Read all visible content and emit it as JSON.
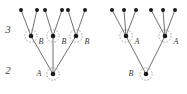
{
  "figure": {
    "background_color": "#ffffff",
    "line_color": "#4d4d4d",
    "node_color": "#1a1a1a",
    "halo_color": "#8c8c8c",
    "label_color": "#3a3a3a",
    "level_label_color": "#4a4a4a",
    "width": 187,
    "height": 94
  },
  "level_labels": [
    {
      "text": "3",
      "x": 8,
      "y": 33
    },
    {
      "text": "2",
      "x": 8,
      "y": 74
    }
  ],
  "left_diagram": {
    "name": "left-tree",
    "leaf_nodes": [
      {
        "id": "L1",
        "x": 21,
        "y": 10
      },
      {
        "id": "L2",
        "x": 37,
        "y": 10
      },
      {
        "id": "L3",
        "x": 45,
        "y": 10
      },
      {
        "id": "L4",
        "x": 62,
        "y": 10
      },
      {
        "id": "L5",
        "x": 68,
        "y": 10
      },
      {
        "id": "L6",
        "x": 85,
        "y": 10
      }
    ],
    "mid_nodes": [
      {
        "id": "M1",
        "x": 31,
        "y": 36,
        "label": "B",
        "label_x": 41,
        "label_y": 44,
        "halo": true
      },
      {
        "id": "M2",
        "x": 53,
        "y": 36,
        "label": "B",
        "label_x": 64,
        "label_y": 44,
        "halo": true
      },
      {
        "id": "M3",
        "x": 76,
        "y": 36,
        "label": "B",
        "label_x": 87,
        "label_y": 44,
        "halo": true
      }
    ],
    "root_node": {
      "id": "R1",
      "x": 53,
      "y": 74,
      "label": "A",
      "label_x": 39,
      "label_y": 76,
      "halo": true
    },
    "edges": [
      {
        "from": "L1",
        "to": "M1"
      },
      {
        "from": "L2",
        "to": "M1"
      },
      {
        "from": "L3",
        "to": "M2"
      },
      {
        "from": "L4",
        "to": "M2"
      },
      {
        "from": "L5",
        "to": "M3"
      },
      {
        "from": "L6",
        "to": "M3"
      },
      {
        "from": "M1",
        "to": "R1"
      },
      {
        "from": "M2",
        "to": "R1"
      },
      {
        "from": "M3",
        "to": "R1"
      }
    ]
  },
  "right_diagram": {
    "name": "right-tree",
    "leaf_nodes": [
      {
        "id": "RL1",
        "x": 112,
        "y": 10
      },
      {
        "id": "RL2",
        "x": 124,
        "y": 10
      },
      {
        "id": "RL3",
        "x": 136,
        "y": 10
      },
      {
        "id": "RL4",
        "x": 151,
        "y": 10
      },
      {
        "id": "RL5",
        "x": 163,
        "y": 10
      },
      {
        "id": "RL6",
        "x": 175,
        "y": 10
      }
    ],
    "mid_nodes": [
      {
        "id": "RM1",
        "x": 126,
        "y": 36,
        "label": "A",
        "label_x": 137,
        "label_y": 44,
        "halo": true
      },
      {
        "id": "RM2",
        "x": 165,
        "y": 36,
        "label": "A",
        "label_x": 176,
        "label_y": 44,
        "halo": true
      }
    ],
    "root_node": {
      "id": "RR1",
      "x": 146,
      "y": 74,
      "label": "B",
      "label_x": 131,
      "label_y": 76,
      "halo": true
    },
    "edges": [
      {
        "from": "RL1",
        "to": "RM1"
      },
      {
        "from": "RL2",
        "to": "RM1"
      },
      {
        "from": "RL3",
        "to": "RM1"
      },
      {
        "from": "RL4",
        "to": "RM2"
      },
      {
        "from": "RL5",
        "to": "RM2"
      },
      {
        "from": "RL6",
        "to": "RM2"
      },
      {
        "from": "RM1",
        "to": "RR1"
      },
      {
        "from": "RM2",
        "to": "RR1"
      }
    ]
  },
  "geometry": {
    "leaf_radius": 2.0,
    "inner_radius": 2.3,
    "halo_radius": 6.2
  }
}
